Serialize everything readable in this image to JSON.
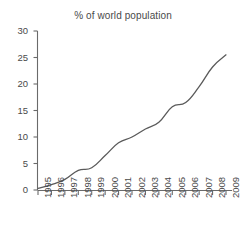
{
  "chart_data": {
    "type": "line",
    "title": "% of world population",
    "xlabel": "",
    "ylabel": "",
    "categories": [
      "1995",
      "1996",
      "1997",
      "1998",
      "1999",
      "2000",
      "2001",
      "2002",
      "2003",
      "2004",
      "2005",
      "2006",
      "2007",
      "2008",
      "2009"
    ],
    "values": [
      0.3,
      1.0,
      2.0,
      3.7,
      4.2,
      6.5,
      8.9,
      10.0,
      11.5,
      12.8,
      15.7,
      16.5,
      19.5,
      23.2,
      25.5
    ],
    "xlim": [
      1995,
      2009
    ],
    "ylim": [
      0,
      30
    ],
    "yticks": [
      "0",
      "5",
      "10",
      "15",
      "20",
      "25",
      "30"
    ],
    "ytick_values": [
      0,
      5,
      10,
      15,
      20,
      25,
      30
    ],
    "grid": false,
    "legend": null,
    "legend_position": "none",
    "line_color": "#5a5a5a",
    "axis_color": "#6a6a6a",
    "text_color": "#4a4a4a",
    "background": "#ffffff"
  }
}
